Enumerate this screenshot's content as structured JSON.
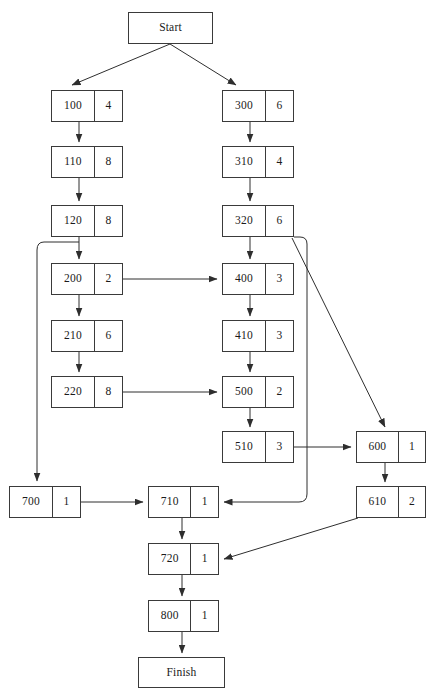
{
  "diagram": {
    "type": "flowchart",
    "stroke_color": "#3a3a3a",
    "text_color": "#1a1a1a",
    "background_color": "#ffffff",
    "canvas": {
      "width": 433,
      "height": 696
    },
    "nodes": [
      {
        "key": "start",
        "kind": "terminal",
        "label": "Start",
        "x": 128,
        "y": 12,
        "w": 85,
        "h": 32
      },
      {
        "key": "n100",
        "kind": "split",
        "id": "100",
        "count": "4",
        "x": 51,
        "y": 90,
        "w": 72,
        "h": 32
      },
      {
        "key": "n110",
        "kind": "split",
        "id": "110",
        "count": "8",
        "x": 51,
        "y": 146,
        "w": 72,
        "h": 32
      },
      {
        "key": "n120",
        "kind": "split",
        "id": "120",
        "count": "8",
        "x": 51,
        "y": 205,
        "w": 72,
        "h": 32
      },
      {
        "key": "n200",
        "kind": "split",
        "id": "200",
        "count": "2",
        "x": 51,
        "y": 263,
        "w": 72,
        "h": 32
      },
      {
        "key": "n210",
        "kind": "split",
        "id": "210",
        "count": "6",
        "x": 51,
        "y": 320,
        "w": 72,
        "h": 32
      },
      {
        "key": "n220",
        "kind": "split",
        "id": "220",
        "count": "8",
        "x": 51,
        "y": 376,
        "w": 72,
        "h": 32
      },
      {
        "key": "n700",
        "kind": "split",
        "id": "700",
        "count": "1",
        "x": 9,
        "y": 486,
        "w": 72,
        "h": 32
      },
      {
        "key": "n300",
        "kind": "split",
        "id": "300",
        "count": "6",
        "x": 222,
        "y": 90,
        "w": 72,
        "h": 32
      },
      {
        "key": "n310",
        "kind": "split",
        "id": "310",
        "count": "4",
        "x": 222,
        "y": 146,
        "w": 72,
        "h": 32
      },
      {
        "key": "n320",
        "kind": "split",
        "id": "320",
        "count": "6",
        "x": 222,
        "y": 205,
        "w": 72,
        "h": 32
      },
      {
        "key": "n400",
        "kind": "split",
        "id": "400",
        "count": "3",
        "x": 222,
        "y": 263,
        "w": 72,
        "h": 32
      },
      {
        "key": "n410",
        "kind": "split",
        "id": "410",
        "count": "3",
        "x": 222,
        "y": 320,
        "w": 72,
        "h": 32
      },
      {
        "key": "n500",
        "kind": "split",
        "id": "500",
        "count": "2",
        "x": 222,
        "y": 376,
        "w": 72,
        "h": 32
      },
      {
        "key": "n510",
        "kind": "split",
        "id": "510",
        "count": "3",
        "x": 222,
        "y": 431,
        "w": 72,
        "h": 32
      },
      {
        "key": "n600",
        "kind": "split",
        "id": "600",
        "count": "1",
        "x": 356,
        "y": 431,
        "w": 70,
        "h": 32
      },
      {
        "key": "n610",
        "kind": "split",
        "id": "610",
        "count": "2",
        "x": 356,
        "y": 486,
        "w": 70,
        "h": 32
      },
      {
        "key": "n710",
        "kind": "split",
        "id": "710",
        "count": "1",
        "x": 148,
        "y": 486,
        "w": 71,
        "h": 32
      },
      {
        "key": "n720",
        "kind": "split",
        "id": "720",
        "count": "1",
        "x": 148,
        "y": 543,
        "w": 71,
        "h": 32
      },
      {
        "key": "n800",
        "kind": "split",
        "id": "800",
        "count": "1",
        "x": 148,
        "y": 600,
        "w": 71,
        "h": 32
      },
      {
        "key": "finish",
        "kind": "terminal",
        "label": "Finish",
        "x": 138,
        "y": 657,
        "w": 87,
        "h": 31
      }
    ],
    "edges": [
      {
        "from": "start",
        "to": "n100",
        "style": "diagonal"
      },
      {
        "from": "start",
        "to": "n300",
        "style": "diagonal"
      },
      {
        "from": "n100",
        "to": "n110",
        "style": "vertical"
      },
      {
        "from": "n110",
        "to": "n120",
        "style": "vertical"
      },
      {
        "from": "n120",
        "to": "n200",
        "style": "vertical"
      },
      {
        "from": "n120",
        "to": "n700",
        "style": "orthogonal-left"
      },
      {
        "from": "n200",
        "to": "n210",
        "style": "vertical"
      },
      {
        "from": "n200",
        "to": "n400",
        "style": "horizontal"
      },
      {
        "from": "n210",
        "to": "n220",
        "style": "vertical"
      },
      {
        "from": "n220",
        "to": "n500",
        "style": "horizontal"
      },
      {
        "from": "n300",
        "to": "n310",
        "style": "vertical"
      },
      {
        "from": "n310",
        "to": "n320",
        "style": "vertical"
      },
      {
        "from": "n320",
        "to": "n400",
        "style": "vertical"
      },
      {
        "from": "n320",
        "to": "n600",
        "style": "diagonal"
      },
      {
        "from": "n320",
        "to": "n710",
        "style": "orthogonal-right"
      },
      {
        "from": "n400",
        "to": "n410",
        "style": "vertical"
      },
      {
        "from": "n410",
        "to": "n500",
        "style": "vertical"
      },
      {
        "from": "n500",
        "to": "n510",
        "style": "vertical"
      },
      {
        "from": "n510",
        "to": "n600",
        "style": "horizontal"
      },
      {
        "from": "n600",
        "to": "n610",
        "style": "vertical"
      },
      {
        "from": "n610",
        "to": "n720",
        "style": "diagonal"
      },
      {
        "from": "n700",
        "to": "n710",
        "style": "horizontal"
      },
      {
        "from": "n710",
        "to": "n720",
        "style": "vertical"
      },
      {
        "from": "n720",
        "to": "n800",
        "style": "vertical"
      },
      {
        "from": "n800",
        "to": "finish",
        "style": "vertical"
      }
    ]
  }
}
